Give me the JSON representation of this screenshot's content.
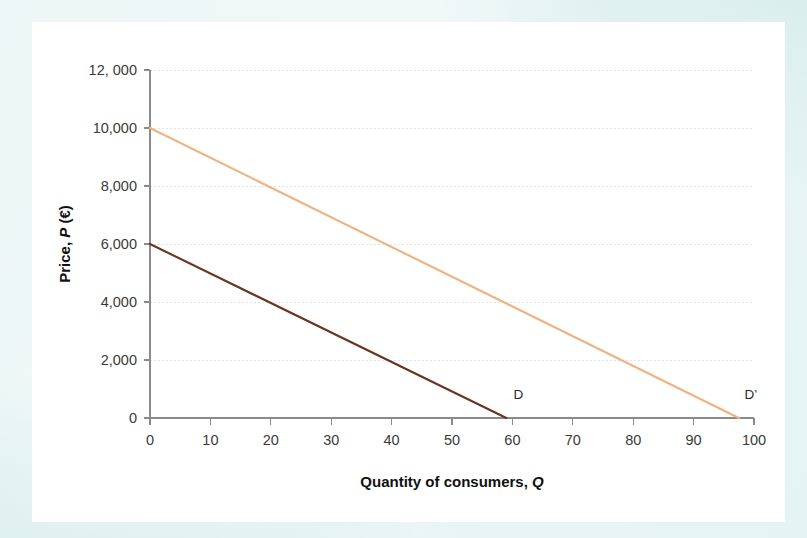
{
  "colors": {
    "page_background": "#dff0ef",
    "card_background": "#ffffff",
    "axis": "#8a8a8a",
    "gridline": "#e2e2e2",
    "text": "#3a3a3a",
    "series_d": "#6b3420",
    "series_dprime": "#f0b27f"
  },
  "chart_data": {
    "type": "line",
    "title": "",
    "subtitle": "",
    "xlabel": "Quantity of consumers, Q",
    "ylabel": "Price, P (€)",
    "xlim": [
      0,
      100
    ],
    "ylim": [
      0,
      12000
    ],
    "grid": true,
    "legend_position": "none",
    "xticks": [
      0,
      10,
      20,
      30,
      40,
      50,
      60,
      70,
      80,
      90,
      100
    ],
    "xtick_labels": [
      "0",
      "10",
      "20",
      "30",
      "40",
      "50",
      "60",
      "70",
      "80",
      "90",
      "100"
    ],
    "yticks": [
      0,
      2000,
      4000,
      6000,
      8000,
      10000,
      12000
    ],
    "ytick_labels": [
      "0",
      "2,000",
      "4,000",
      "6,000",
      "8,000",
      "10,000",
      "12, 000"
    ],
    "series": [
      {
        "name": "D",
        "label": "D",
        "color": "#6b3420",
        "width": 2.1,
        "x": [
          0,
          59
        ],
        "y": [
          6000,
          0
        ],
        "annotation": {
          "text": "D",
          "x": 61,
          "y": 650
        }
      },
      {
        "name": "D'",
        "label": "D'",
        "color": "#f0b27f",
        "width": 2.1,
        "x": [
          0,
          97.5
        ],
        "y": [
          10000,
          0
        ],
        "annotation": {
          "text": "D’",
          "x": 99.5,
          "y": 650
        }
      }
    ]
  }
}
